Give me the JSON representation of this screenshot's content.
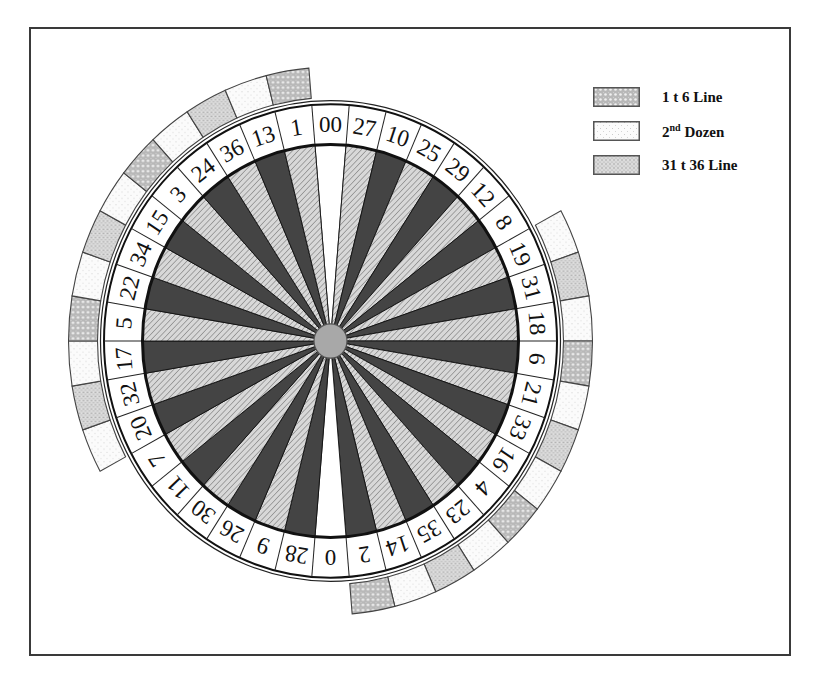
{
  "diagram": {
    "type": "american-roulette-wheel",
    "pockets_clockwise_from_top": [
      "00",
      "27",
      "10",
      "25",
      "29",
      "12",
      "8",
      "19",
      "31",
      "18",
      "6",
      "21",
      "33",
      "16",
      "4",
      "23",
      "35",
      "14",
      "2",
      "0",
      "28",
      "9",
      "26",
      "30",
      "11",
      "7",
      "20",
      "32",
      "17",
      "5",
      "22",
      "34",
      "15",
      "3",
      "24",
      "36",
      "13",
      "1"
    ],
    "pocket_colors": {
      "green": [
        "0",
        "00"
      ],
      "red": [
        "1",
        "3",
        "5",
        "7",
        "9",
        "12",
        "14",
        "16",
        "18",
        "19",
        "21",
        "23",
        "25",
        "27",
        "30",
        "32",
        "34",
        "36"
      ],
      "black": [
        "2",
        "4",
        "6",
        "8",
        "10",
        "11",
        "13",
        "15",
        "17",
        "20",
        "22",
        "24",
        "26",
        "28",
        "29",
        "31",
        "33",
        "35"
      ]
    },
    "wedge_fills": {
      "green": "#ffffff",
      "red": "hatch-light",
      "black": "#444444"
    },
    "hub_color": "#a8a8a8",
    "outer_bands": [
      {
        "name": "top-left-arc",
        "pockets": [
          "20",
          "32",
          "17",
          "5",
          "22",
          "34",
          "15",
          "3",
          "24",
          "36",
          "13",
          "1"
        ],
        "categories": [
          "dozen2",
          "line31",
          "dozen2",
          "line1",
          "dozen2",
          "line31",
          "dozen2",
          "line1",
          "dozen2",
          "line31",
          "dozen2",
          "line1"
        ]
      },
      {
        "name": "bottom-right-arc",
        "pockets": [
          "19",
          "31",
          "18",
          "6",
          "21",
          "33",
          "16",
          "4",
          "23",
          "35",
          "14",
          "2"
        ],
        "categories": [
          "dozen2",
          "line31",
          "dozen2",
          "line1",
          "dozen2",
          "line31",
          "dozen2",
          "line1",
          "dozen2",
          "line31",
          "dozen2",
          "line1"
        ]
      }
    ]
  },
  "legend": {
    "items": [
      {
        "key": "line1",
        "label": "1 t 6 Line",
        "pattern": "crosshatch"
      },
      {
        "key": "dozen2",
        "label_main": "2",
        "label_sup": "nd",
        "label_rest": " Dozen",
        "pattern": "light-dots"
      },
      {
        "key": "line31",
        "label": "31 t 36 Line",
        "pattern": "stipple"
      }
    ]
  }
}
